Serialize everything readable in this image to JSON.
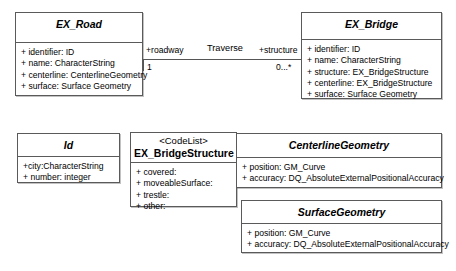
{
  "diagram": {
    "type": "uml-class-diagram",
    "background": "#ffffff",
    "line_color": "#5a5a5a"
  },
  "classes": {
    "ex_road": {
      "name": "EX_Road",
      "attributes": [
        "+ identifier: ID",
        "+ name: CharacterString",
        "+ centerline: CenterlineGeometry",
        "+ surface: Surface Geometry"
      ]
    },
    "ex_bridge": {
      "name": "EX_Bridge",
      "attributes": [
        "+ identifier: ID",
        "+ name: CharacterString",
        "+ structure: EX_BridgeStructure",
        "+ centerline: EX_BridgeStructure",
        "+ surface: Surface Geometry"
      ]
    },
    "id": {
      "name": "Id",
      "attributes": [
        "+city:CharacterString",
        "+ number: integer"
      ]
    },
    "ex_bridge_structure": {
      "stereotype": "<CodeList>",
      "name": "EX_BridgeStructure",
      "attributes": [
        "+ covered:",
        "+ moveableSurface:",
        "+ trestle:",
        "+ other:"
      ]
    },
    "centerline_geometry": {
      "name": "CenterlineGeometry",
      "attributes": [
        "+ position: GM_Curve",
        "+ accuracy: DQ_AbsoluteExternalPositionalAccuracy"
      ]
    },
    "surface_geometry": {
      "name": "SurfaceGeometry",
      "attributes": [
        "+ position: GM_Curve",
        "+ accuracy: DQ_AbsoluteExternalPositionalAccuracy"
      ]
    }
  },
  "association": {
    "name": "Traverse",
    "source_role": "+roadway",
    "source_multiplicity": "1",
    "target_role": "+structure",
    "target_multiplicity": "0...*"
  }
}
